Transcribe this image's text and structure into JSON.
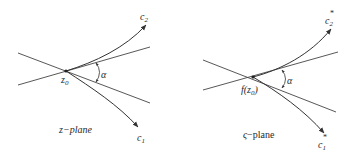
{
  "figure": {
    "left_panel": {
      "plane_label": "z−plane",
      "point_label": "z",
      "point_subscript": "0",
      "angle_label": "α",
      "curve_1_label": "c",
      "curve_1_subscript": "1",
      "curve_2_label": "c",
      "curve_2_subscript": "2"
    },
    "right_panel": {
      "plane_label_symbol": "ς",
      "plane_label_suffix": "−plane",
      "point_label": "f(z",
      "point_subscript": "0",
      "point_close": ")",
      "angle_label": "α",
      "curve_1_label": "c",
      "curve_1_subscript": "1",
      "curve_1_superscript": "*",
      "curve_2_label": "c",
      "curve_2_subscript": "2",
      "curve_2_superscript": "*"
    },
    "colors": {
      "stroke": "#333333",
      "background": "#ffffff"
    }
  }
}
